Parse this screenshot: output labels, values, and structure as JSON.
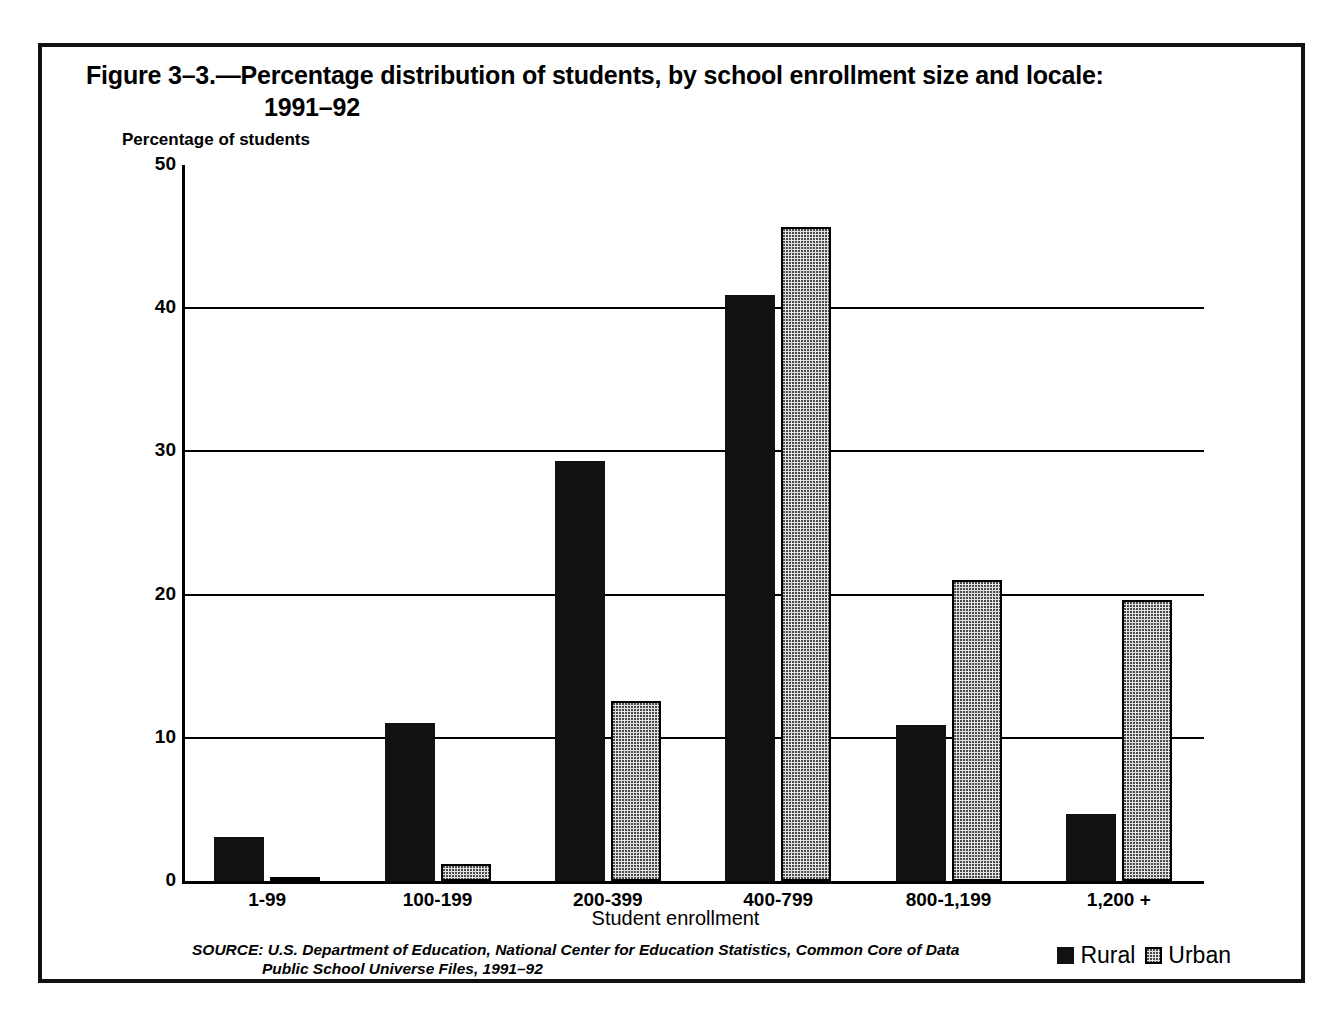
{
  "figure": {
    "title_line_1": "Figure 3–3.—Percentage distribution of students, by school enrollment size and locale:",
    "title_line_2": "1991–92",
    "source_line_1": "SOURCE: U.S. Department of Education, National Center for Education Statistics, Common Core of Data",
    "source_line_2": "Public School Universe Files, 1991–92"
  },
  "legend": {
    "rural_label": "Rural",
    "urban_label": "Urban"
  },
  "axis": {
    "y_title": "Percentage of students",
    "x_title": "Student enrollment",
    "y_ticks": [
      "50",
      "40",
      "30",
      "20",
      "10",
      "0"
    ]
  },
  "colors": {
    "rural": "#111111",
    "urban_fill": "#e2e2e2",
    "urban_dot": "#4a4a4a",
    "axis": "#000000",
    "frame": "#111111"
  },
  "chart_data": {
    "type": "bar",
    "title": "Figure 3–3.—Percentage distribution of students, by school enrollment size and locale: 1991–92",
    "xlabel": "Student enrollment",
    "ylabel": "Percentage of students",
    "ylim": [
      0,
      50
    ],
    "yticks": [
      0,
      10,
      20,
      30,
      40,
      50
    ],
    "grid": true,
    "legend_position": "bottom-right",
    "categories": [
      "1-99",
      "100-199",
      "200-399",
      "400-799",
      "800-1,199",
      "1,200 +"
    ],
    "series": [
      {
        "name": "Rural",
        "values": [
          3.1,
          11.0,
          29.3,
          40.9,
          10.9,
          4.7
        ]
      },
      {
        "name": "Urban",
        "values": [
          0.3,
          1.2,
          12.6,
          45.7,
          21.0,
          19.6
        ]
      }
    ]
  }
}
